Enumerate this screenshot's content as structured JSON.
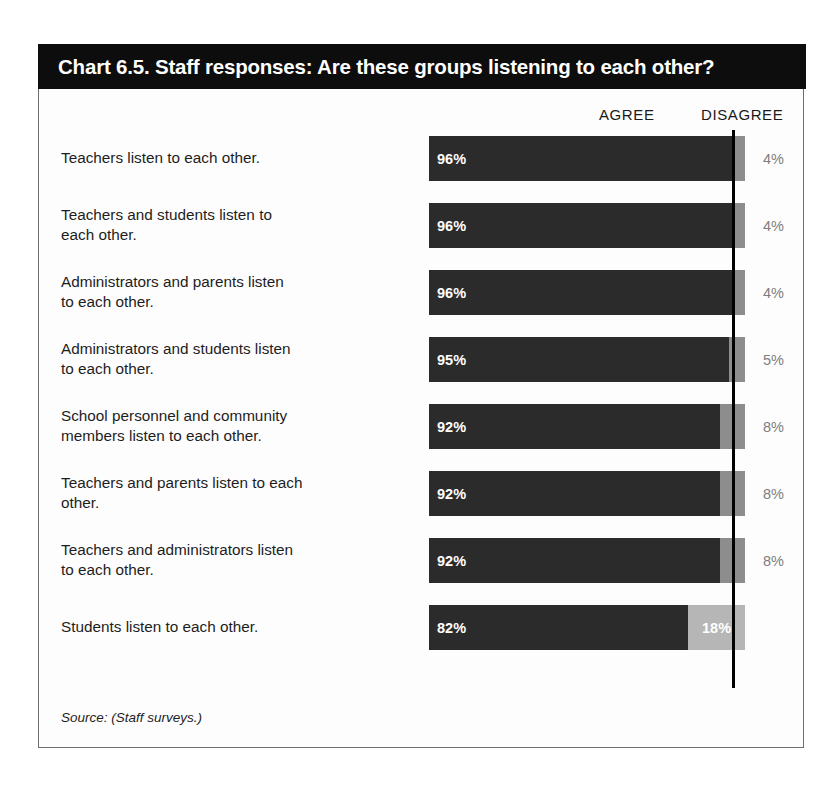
{
  "chart_title": "Chart 6.5. Staff responses: Are these groups listening to each other?",
  "columns": {
    "agree": "AGREE",
    "disagree": "DISAGREE"
  },
  "source_note": "Source: (Staff surveys.)",
  "colors": {
    "title_bar": "#0d0d0d",
    "agree_bar": "#2b2b2b",
    "disagree_bar": "#8d8d8d",
    "disagree_bar_light": "#b6b6b6",
    "reference_line": "#000000",
    "frame_border": "#6e6e6e"
  },
  "chart_data": {
    "type": "bar",
    "title": "Chart 6.5. Staff responses: Are these groups listening to each other?",
    "xlabel": "",
    "ylabel": "",
    "xlim": [
      0,
      100
    ],
    "grid": false,
    "legend_position": "top-right",
    "orientation": "horizontal",
    "stacked": true,
    "categories": [
      "Teachers listen to each other.",
      "Teachers and students listen to each other.",
      "Administrators and parents listen to each other.",
      "Administrators and students listen to each other.",
      "School personnel and community members listen to each other.",
      "Teachers and parents listen to each other.",
      "Teachers and administrators listen to each other.",
      "Students listen to each other."
    ],
    "series": [
      {
        "name": "AGREE",
        "values": [
          96,
          96,
          96,
          95,
          92,
          92,
          92,
          82
        ]
      },
      {
        "name": "DISAGREE",
        "values": [
          4,
          4,
          4,
          5,
          8,
          8,
          8,
          18
        ]
      }
    ],
    "reference_line_at": 96
  },
  "rows": [
    {
      "label_line1": "Teachers listen to each other.",
      "label_line2": "",
      "agree": "96%",
      "disagree": "4%",
      "agree_pct": 96,
      "disagree_pct": 4,
      "disagree_inside": false
    },
    {
      "label_line1": "Teachers and students listen to",
      "label_line2": "each other.",
      "agree": "96%",
      "disagree": "4%",
      "agree_pct": 96,
      "disagree_pct": 4,
      "disagree_inside": false
    },
    {
      "label_line1": "Administrators and parents listen",
      "label_line2": "to each other.",
      "agree": "96%",
      "disagree": "4%",
      "agree_pct": 96,
      "disagree_pct": 4,
      "disagree_inside": false
    },
    {
      "label_line1": "Administrators and students listen",
      "label_line2": "to each other.",
      "agree": "95%",
      "disagree": "5%",
      "agree_pct": 95,
      "disagree_pct": 5,
      "disagree_inside": false
    },
    {
      "label_line1": "School personnel and community",
      "label_line2": "members listen to each other.",
      "agree": "92%",
      "disagree": "8%",
      "agree_pct": 92,
      "disagree_pct": 8,
      "disagree_inside": false
    },
    {
      "label_line1": "Teachers and parents listen to each",
      "label_line2": "other.",
      "agree": "92%",
      "disagree": "8%",
      "agree_pct": 92,
      "disagree_pct": 8,
      "disagree_inside": false
    },
    {
      "label_line1": "Teachers and administrators listen",
      "label_line2": "to each other.",
      "agree": "92%",
      "disagree": "8%",
      "agree_pct": 92,
      "disagree_pct": 8,
      "disagree_inside": false
    },
    {
      "label_line1": "Students listen to each other.",
      "label_line2": "",
      "agree": "82%",
      "disagree": "18%",
      "agree_pct": 82,
      "disagree_pct": 18,
      "disagree_inside": true
    }
  ]
}
